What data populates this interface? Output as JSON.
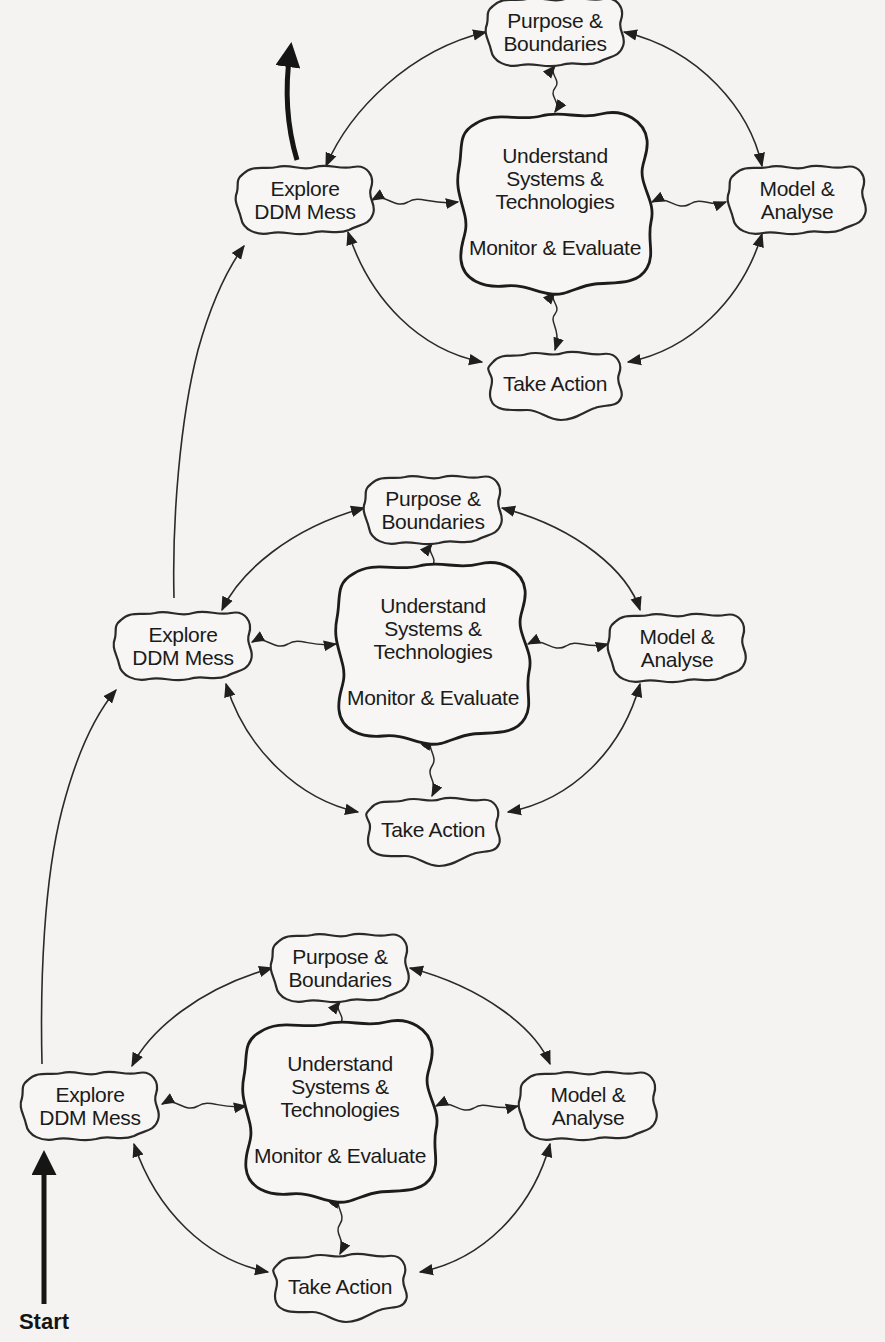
{
  "figure": {
    "type": "cyclic process diagram (three stacked iterations)",
    "start_label": "Start",
    "cycles": [
      {
        "id": "cycle-top",
        "nodes": {
          "purpose": [
            "Purpose &",
            "Boundaries"
          ],
          "explore": [
            "Explore",
            "DDM Mess"
          ],
          "core_top": [
            "Understand",
            "Systems &",
            "Technologies"
          ],
          "core_bottom": "Monitor & Evaluate",
          "model": [
            "Model &",
            "Analyse"
          ],
          "action": "Take Action"
        }
      },
      {
        "id": "cycle-middle",
        "nodes": {
          "purpose": [
            "Purpose &",
            "Boundaries"
          ],
          "explore": [
            "Explore",
            "DDM Mess"
          ],
          "core_top": [
            "Understand",
            "Systems &",
            "Technologies"
          ],
          "core_bottom": "Monitor & Evaluate",
          "model": [
            "Model &",
            "Analyse"
          ],
          "action": "Take Action"
        }
      },
      {
        "id": "cycle-bottom",
        "nodes": {
          "purpose": [
            "Purpose &",
            "Boundaries"
          ],
          "explore": [
            "Explore",
            "DDM Mess"
          ],
          "core_top": [
            "Understand",
            "Systems &",
            "Technologies"
          ],
          "core_bottom": "Monitor & Evaluate",
          "model": [
            "Model &",
            "Analyse"
          ],
          "action": "Take Action"
        }
      }
    ],
    "edges": [
      "Explore DDM Mess <-> Purpose & Boundaries",
      "Purpose & Boundaries <-> Model & Analyse",
      "Model & Analyse <-> Take Action",
      "Take Action <-> Explore DDM Mess",
      "Core (Understand Systems & Technologies / Monitor & Evaluate) <~> each outer node (wavy)",
      "Start -> Explore DDM Mess (bottom cycle)",
      "Explore DDM Mess (bottom) -> Explore DDM Mess (middle)",
      "Explore DDM Mess (middle) -> Explore DDM Mess (top)",
      "Explore DDM Mess (top) -> continuing upward (bold)"
    ]
  },
  "colors": {
    "paper": "#f4f3f1",
    "ink": "#1b1b1b",
    "bleed_through": "#d9d7d3"
  }
}
